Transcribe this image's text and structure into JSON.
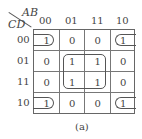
{
  "kmap": {
    "row_var": "CD",
    "col_var": "AB",
    "col_labels": [
      "00",
      "01",
      "11",
      "10"
    ],
    "row_labels": [
      "00",
      "01",
      "11",
      "10"
    ],
    "cells": [
      [
        "1",
        "0",
        "0",
        "1"
      ],
      [
        "0",
        "1",
        "1",
        "0"
      ],
      [
        "0",
        "1",
        "1",
        "0"
      ],
      [
        "1",
        "0",
        "0",
        "1"
      ]
    ],
    "groups": [
      "corners (wrap-around)",
      "center 2x2"
    ],
    "caption": "(a)"
  }
}
